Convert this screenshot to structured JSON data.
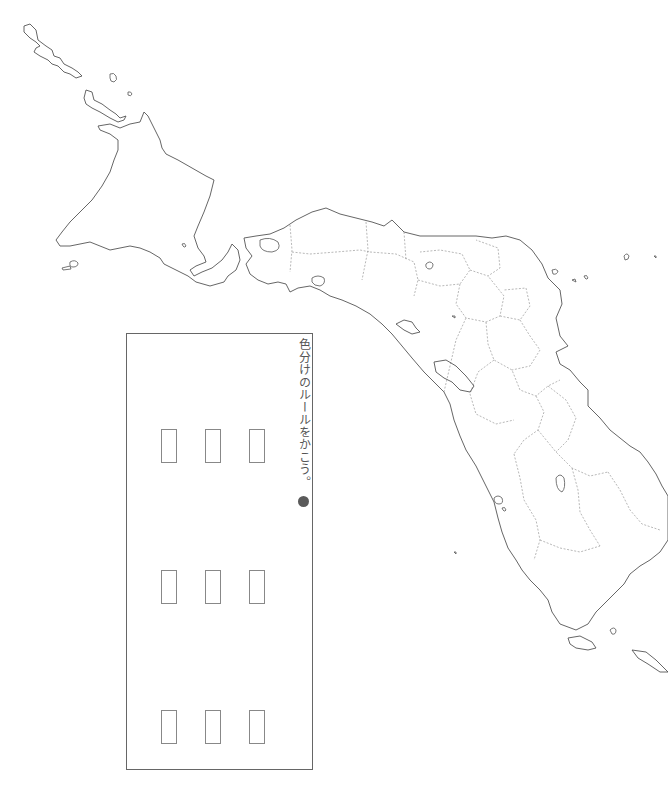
{
  "worksheet": {
    "instruction_text": "色分けのルールをかこう。",
    "bullet_symbol": "●",
    "bullet_color": "#5a5a5a",
    "line_color": "#666666"
  },
  "legend": {
    "rows": 3,
    "columns": 3,
    "swatches": [
      {
        "row": 1,
        "col": 1,
        "x": 161,
        "y": 429
      },
      {
        "row": 1,
        "col": 2,
        "x": 205,
        "y": 429
      },
      {
        "row": 1,
        "col": 3,
        "x": 249,
        "y": 429
      },
      {
        "row": 2,
        "col": 1,
        "x": 161,
        "y": 570
      },
      {
        "row": 2,
        "col": 2,
        "x": 205,
        "y": 570
      },
      {
        "row": 2,
        "col": 3,
        "x": 249,
        "y": 570
      },
      {
        "row": 3,
        "col": 1,
        "x": 161,
        "y": 710
      },
      {
        "row": 3,
        "col": 2,
        "x": 205,
        "y": 710
      },
      {
        "row": 3,
        "col": 3,
        "x": 249,
        "y": 710
      }
    ]
  },
  "map": {
    "style": "blank outline map, rotated",
    "coastline_color": "#555555",
    "border_color": "#999999",
    "border_style": "dotted"
  }
}
